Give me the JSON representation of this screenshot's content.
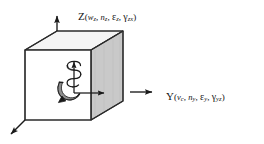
{
  "figure": {
    "background_color": "#ffffff",
    "ink_color": "#151515",
    "cube": {
      "front_face_color": "#ffffff",
      "top_face_color": "#f2f2f2",
      "right_face_color": "#c8c8c8",
      "edge_color": "#2b2b2b"
    },
    "axes": [
      {
        "name": "Z",
        "direction": "up",
        "label_parts": {
          "base": "Z",
          "open": "(",
          "v1": "w",
          "v1_sub": "z",
          "sep1": ", ",
          "v2": "n",
          "v2_sub": "z",
          "sep2": ", ",
          "v3": "ε",
          "v3_sub": "z",
          "sep3": ", ",
          "v4": "γ",
          "v4_sub": "zx",
          "close": ")"
        },
        "label_text": "Z(w₂, n₂, ε₂, γ₂ₓ)"
      },
      {
        "name": "Y",
        "direction": "right",
        "label_parts": {
          "base": "Y",
          "open": "(",
          "v1": "v",
          "v1_sub": "c",
          "sep1": ", ",
          "v2": "n",
          "v2_sub": "y",
          "sep2": ", ",
          "v3": "ε",
          "v3_sub": "y",
          "sep3": ", ",
          "v4": "γ",
          "v4_sub": "yz",
          "close": ")"
        },
        "label_text": "Y(vᴄ, nᵧ, εᵧ, γᵧ₂)"
      },
      {
        "name": "X",
        "direction": "down-left",
        "label_parts": null,
        "label_text": ""
      }
    ],
    "annotations": [
      {
        "name": "torsion-helix",
        "description": "helical spiral wound around the vertical axis indicating torsion"
      },
      {
        "name": "rotation-curl",
        "description": "curved hook arrow at the origin indicating rotation"
      },
      {
        "name": "origin-arrow-up",
        "description": "interior vertical arrow from origin"
      },
      {
        "name": "origin-arrow-right",
        "description": "interior horizontal arrow from origin"
      }
    ]
  }
}
